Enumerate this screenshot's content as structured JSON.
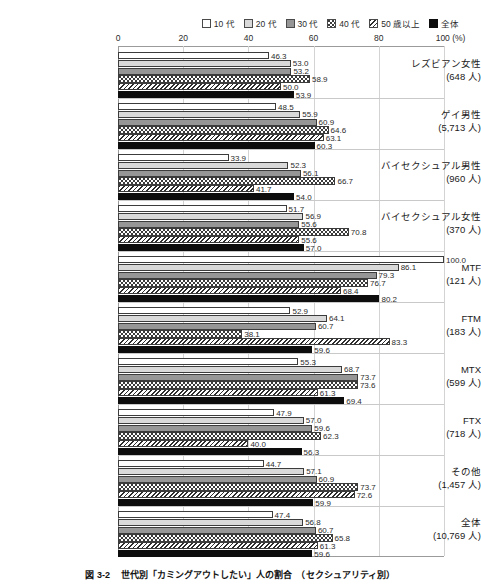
{
  "legend": {
    "position": "top-right",
    "items": [
      {
        "label": "10 代",
        "pattern": "white-solid"
      },
      {
        "label": "20 代",
        "pattern": "light-gray-solid"
      },
      {
        "label": "30 代",
        "pattern": "medium-gray-solid"
      },
      {
        "label": "40 代",
        "pattern": "dotted-checker"
      },
      {
        "label": "50 歳以上",
        "pattern": "diagonal-hatch"
      },
      {
        "label": "全体",
        "pattern": "black-solid"
      }
    ]
  },
  "axis": {
    "x_ticks": [
      "0",
      "20",
      "40",
      "60",
      "80",
      "100 (%)"
    ],
    "x_tick_values": [
      0,
      20,
      40,
      60,
      80,
      100
    ],
    "unit": "(%)"
  },
  "caption": "図 3-2 　世代別「カミングアウトしたい」人の割合　（セクシュアリティ別）",
  "chart_data": {
    "type": "bar",
    "orientation": "horizontal",
    "title": "",
    "xlabel": "(%)",
    "ylabel": "",
    "xlim": [
      0,
      100
    ],
    "grid": true,
    "legend_position": "top-right",
    "categories": [
      "レズビアン女性",
      "ゲイ男性",
      "バイセクシュアル男性",
      "バイセクシュアル女性",
      "MTF",
      "FTM",
      "MTX",
      "FTX",
      "その他",
      "全体"
    ],
    "category_counts": [
      "(648 人)",
      "(5,713 人)",
      "(960 人)",
      "(370 人)",
      "(121 人)",
      "(183 人)",
      "(599 人)",
      "(718 人)",
      "(1,457 人)",
      "(10,769 人)"
    ],
    "series": [
      {
        "name": "10 代",
        "values": [
          46.3,
          48.5,
          33.9,
          51.7,
          100.0,
          52.9,
          55.3,
          47.9,
          44.7,
          47.4
        ]
      },
      {
        "name": "20 代",
        "values": [
          53.0,
          55.9,
          52.3,
          56.9,
          86.1,
          64.1,
          68.7,
          57.0,
          57.1,
          56.8
        ]
      },
      {
        "name": "30 代",
        "values": [
          53.2,
          60.9,
          56.1,
          55.6,
          79.3,
          60.7,
          73.7,
          59.6,
          60.9,
          60.7
        ]
      },
      {
        "name": "40 代",
        "values": [
          58.9,
          64.6,
          66.7,
          70.8,
          76.7,
          38.1,
          73.6,
          62.3,
          73.7,
          65.8
        ]
      },
      {
        "name": "50 歳以上",
        "values": [
          50.0,
          63.1,
          41.7,
          55.6,
          68.4,
          83.3,
          61.3,
          40.0,
          72.6,
          61.3
        ]
      },
      {
        "name": "全体",
        "values": [
          53.9,
          60.3,
          54.0,
          57.0,
          80.2,
          59.6,
          69.4,
          56.3,
          59.9,
          59.6
        ]
      }
    ]
  }
}
